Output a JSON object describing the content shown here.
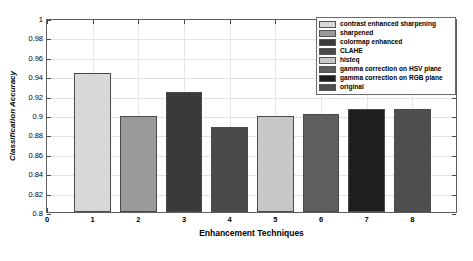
{
  "chart_data": {
    "type": "bar",
    "title": "",
    "xlabel": "Enhancement Techniques",
    "ylabel": "Classification Accuracy",
    "categories": [
      "1",
      "2",
      "3",
      "4",
      "5",
      "6",
      "7",
      "8"
    ],
    "values": [
      0.943,
      0.899,
      0.924,
      0.888,
      0.899,
      0.901,
      0.906,
      0.906
    ],
    "series": [
      {
        "name": "Classification Accuracy",
        "values": [
          0.943,
          0.899,
          0.924,
          0.888,
          0.899,
          0.901,
          0.906,
          0.906
        ]
      }
    ],
    "bar_colors": [
      "#d8d8d8",
      "#9a9a9a",
      "#3a3a3a",
      "#4a4a4a",
      "#c8c8c8",
      "#5e5e5e",
      "#1e1e1e",
      "#4f4f4f"
    ],
    "ylim": [
      0.8,
      1.0
    ],
    "xlim": [
      0,
      9
    ],
    "yticks": [
      "0.8",
      "0.82",
      "0.84",
      "0.86",
      "0.88",
      "0.9",
      "0.92",
      "0.94",
      "0.96",
      "0.98",
      "1"
    ],
    "ytick_values": [
      0.8,
      0.82,
      0.84,
      0.86,
      0.88,
      0.9,
      0.92,
      0.94,
      0.96,
      0.98,
      1.0
    ],
    "xticks": [
      "0",
      "1",
      "2",
      "3",
      "4",
      "5",
      "6",
      "7",
      "8"
    ],
    "xtick_values": [
      0,
      1,
      2,
      3,
      4,
      5,
      6,
      7,
      8
    ],
    "grid": true,
    "legend_position": "top-right",
    "legend": [
      {
        "label": "contrast enhanced sharpening",
        "color": "#d8d8d8"
      },
      {
        "label": "sharpened",
        "color": "#9a9a9a"
      },
      {
        "label": "colormap enhanced",
        "color": "#3a3a3a"
      },
      {
        "label": "CLAHE",
        "color": "#4a4a4a"
      },
      {
        "label": "histeq",
        "color": "#c8c8c8"
      },
      {
        "label": "gamma correction on HSV plane",
        "color": "#5e5e5e"
      },
      {
        "label": "gamma correction on RGB plane",
        "color": "#1e1e1e"
      },
      {
        "label": "original",
        "color": "#4f4f4f"
      }
    ]
  },
  "figure": {
    "background": "#ffffff",
    "axis_color": "#5f5f5f",
    "grid_color": "#e2e2e2"
  }
}
